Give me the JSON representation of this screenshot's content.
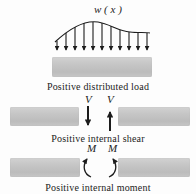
{
  "figure": {
    "load_label": "w ( x )",
    "shear_label_left": "V",
    "shear_label_right": "V",
    "moment_label_left": "M",
    "moment_label_right": "M",
    "captions": {
      "distributed": "Positive distributed load",
      "shear": "Positive internal shear",
      "moment": "Positive internal moment"
    },
    "colors": {
      "ink": "#1c1c1c",
      "beam": "#c6c6c6"
    },
    "load_arrows": {
      "x": [
        12,
        21,
        30,
        39,
        48,
        57,
        66,
        75,
        84,
        93,
        102
      ],
      "y_top": [
        27,
        19,
        13,
        9,
        8,
        9,
        12,
        16,
        18,
        19,
        19
      ],
      "y_bottom": 36
    }
  }
}
